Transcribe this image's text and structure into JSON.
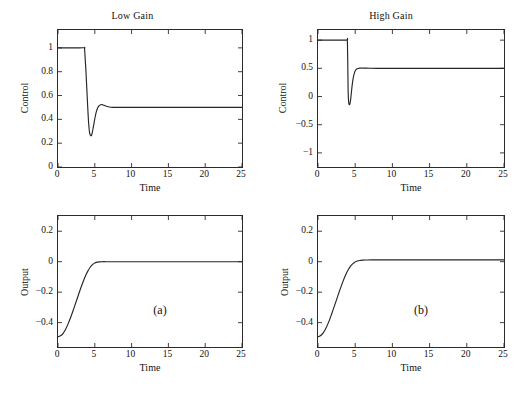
{
  "figure": {
    "width": 529,
    "height": 397,
    "background": "#ffffff",
    "line_color": "#262626",
    "axis_color": "#2b2b2b"
  },
  "panels": [
    {
      "id": "low-gain-control",
      "title": "Low Gain",
      "tag": "",
      "xlabel": "Time",
      "ylabel": "Control",
      "xticks": [
        0,
        5,
        10,
        15,
        20,
        25
      ],
      "xtick_labels": [
        "0",
        "5",
        "10",
        "15",
        "20",
        "25"
      ],
      "yticks": [
        0,
        0.2,
        0.4,
        0.6,
        0.8,
        1
      ],
      "ytick_labels": [
        "0",
        "0.2",
        "0.4",
        "0.6",
        "0.8",
        "1"
      ],
      "xlim": [
        0,
        25
      ],
      "ylim": [
        0,
        1.15
      ]
    },
    {
      "id": "high-gain-control",
      "title": "High Gain",
      "tag": "",
      "xlabel": "Time",
      "ylabel": "Control",
      "xticks": [
        0,
        5,
        10,
        15,
        20,
        25
      ],
      "xtick_labels": [
        "0",
        "5",
        "10",
        "15",
        "20",
        "25"
      ],
      "yticks": [
        -1,
        -0.5,
        0,
        0.5,
        1
      ],
      "ytick_labels": [
        "−1",
        "−0.5",
        "0",
        "0.5",
        "1"
      ],
      "xlim": [
        0,
        25
      ],
      "ylim": [
        -1.25,
        1.18
      ]
    },
    {
      "id": "low-gain-output",
      "title": "",
      "tag": "(a)",
      "xlabel": "Time",
      "ylabel": "Output",
      "xticks": [
        0,
        5,
        10,
        15,
        20,
        25
      ],
      "xtick_labels": [
        "0",
        "5",
        "10",
        "15",
        "20",
        "25"
      ],
      "yticks": [
        -0.4,
        -0.2,
        0,
        0.2
      ],
      "ytick_labels": [
        "−0.4",
        "−0.2",
        "0",
        "0.2"
      ],
      "xlim": [
        0,
        25
      ],
      "ylim": [
        -0.56,
        0.3
      ]
    },
    {
      "id": "high-gain-output",
      "title": "",
      "tag": "(b)",
      "xlabel": "Time",
      "ylabel": "Output",
      "xticks": [
        0,
        5,
        10,
        15,
        20,
        25
      ],
      "xtick_labels": [
        "0",
        "5",
        "10",
        "15",
        "20",
        "25"
      ],
      "yticks": [
        -0.4,
        -0.2,
        0,
        0.2
      ],
      "ytick_labels": [
        "−0.4",
        "−0.2",
        "0",
        "0.2"
      ],
      "xlim": [
        0,
        25
      ],
      "ylim": [
        -0.56,
        0.3
      ]
    }
  ],
  "chart_data": [
    {
      "type": "line",
      "title": "Low Gain",
      "xlabel": "Time",
      "ylabel": "Control",
      "xlim": [
        0,
        25
      ],
      "ylim": [
        0,
        1.15
      ],
      "grid": false,
      "legend": null,
      "annotations": [],
      "series": [
        {
          "name": "control",
          "x": [
            0,
            1,
            2,
            3,
            3.6,
            3.62,
            3.8,
            4.0,
            4.15,
            4.3,
            4.45,
            4.6,
            4.8,
            5.0,
            5.2,
            5.4,
            5.6,
            5.8,
            6.0,
            6.2,
            6.5,
            6.8,
            7.2,
            7.6,
            8,
            9,
            10,
            12,
            15,
            18,
            21,
            25
          ],
          "y": [
            1.0,
            1.0,
            1.0,
            1.0,
            1.0,
            0.985,
            0.8,
            0.55,
            0.38,
            0.285,
            0.262,
            0.275,
            0.335,
            0.405,
            0.462,
            0.497,
            0.515,
            0.523,
            0.524,
            0.519,
            0.512,
            0.506,
            0.502,
            0.5,
            0.5,
            0.5,
            0.5,
            0.5,
            0.5,
            0.5,
            0.5,
            0.5
          ]
        }
      ]
    },
    {
      "type": "line",
      "title": "High Gain",
      "xlabel": "Time",
      "ylabel": "Control",
      "xlim": [
        0,
        25
      ],
      "ylim": [
        -1.25,
        1.18
      ],
      "grid": false,
      "legend": null,
      "annotations": [],
      "series": [
        {
          "name": "control",
          "x": [
            0,
            1,
            2,
            3,
            3.9,
            3.95,
            4.0,
            4.05,
            4.12,
            4.2,
            4.3,
            4.4,
            4.5,
            4.62,
            4.75,
            4.9,
            5.05,
            5.2,
            5.4,
            5.6,
            5.8,
            6.0,
            6.4,
            7,
            8,
            10,
            13,
            16,
            20,
            25
          ],
          "y": [
            1.0,
            1.0,
            1.0,
            1.0,
            1.0,
            1.0,
            0.6,
            0.1,
            -0.1,
            -0.145,
            -0.125,
            -0.04,
            0.09,
            0.23,
            0.34,
            0.42,
            0.465,
            0.487,
            0.498,
            0.503,
            0.505,
            0.505,
            0.503,
            0.501,
            0.5,
            0.5,
            0.5,
            0.5,
            0.5,
            0.5
          ]
        }
      ]
    },
    {
      "type": "line",
      "title": "(a)",
      "xlabel": "Time",
      "ylabel": "Output",
      "xlim": [
        0,
        25
      ],
      "ylim": [
        -0.56,
        0.3
      ],
      "grid": false,
      "legend": null,
      "annotations": [
        {
          "text": "(a)",
          "x": 13.5,
          "y": -0.22
        }
      ],
      "series": [
        {
          "name": "output",
          "x": [
            0,
            0.2,
            0.45,
            0.7,
            1.0,
            1.4,
            1.8,
            2.2,
            2.6,
            3.0,
            3.4,
            3.8,
            4.1,
            4.4,
            4.65,
            4.9,
            5.1,
            5.3,
            5.6,
            6.0,
            6.5,
            7.2,
            8,
            10,
            13,
            16,
            20,
            25
          ],
          "y": [
            -0.492,
            -0.49,
            -0.483,
            -0.47,
            -0.447,
            -0.405,
            -0.355,
            -0.3,
            -0.243,
            -0.186,
            -0.133,
            -0.086,
            -0.058,
            -0.035,
            -0.021,
            -0.011,
            -0.006,
            -0.003,
            -0.001,
            0.0,
            0.0,
            0.0,
            0.0,
            0.0,
            0.0,
            0.0,
            0.0,
            0.0
          ]
        }
      ]
    },
    {
      "type": "line",
      "title": "(b)",
      "xlabel": "Time",
      "ylabel": "Output",
      "xlim": [
        0,
        25
      ],
      "ylim": [
        -0.56,
        0.3
      ],
      "grid": false,
      "legend": null,
      "annotations": [
        {
          "text": "(b)",
          "x": 13.5,
          "y": -0.22
        }
      ],
      "series": [
        {
          "name": "output",
          "x": [
            0,
            0.2,
            0.45,
            0.7,
            1.0,
            1.4,
            1.8,
            2.2,
            2.6,
            3.0,
            3.4,
            3.8,
            4.1,
            4.4,
            4.65,
            4.9,
            5.1,
            5.3,
            5.6,
            6.0,
            6.5,
            7.2,
            8,
            10,
            13,
            16,
            20,
            25
          ],
          "y": [
            -0.492,
            -0.489,
            -0.481,
            -0.467,
            -0.443,
            -0.4,
            -0.348,
            -0.292,
            -0.234,
            -0.177,
            -0.124,
            -0.078,
            -0.05,
            -0.028,
            -0.014,
            -0.005,
            0.001,
            0.005,
            0.008,
            0.01,
            0.011,
            0.012,
            0.012,
            0.012,
            0.012,
            0.012,
            0.012,
            0.012
          ]
        }
      ]
    }
  ]
}
